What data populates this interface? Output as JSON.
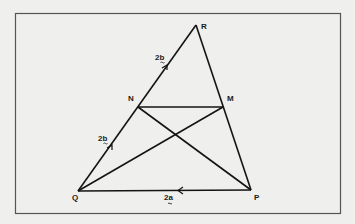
{
  "diagram": {
    "colors": {
      "background": "#efefed",
      "frame": "#555555",
      "line": "#141414"
    },
    "vertices": {
      "R": {
        "label": "R",
        "x": 196,
        "y": 25
      },
      "N": {
        "label": "N",
        "x": 138,
        "y": 107
      },
      "M": {
        "label": "M",
        "x": 223,
        "y": 107
      },
      "Q": {
        "label": "Q",
        "x": 78,
        "y": 191
      },
      "P": {
        "label": "P",
        "x": 251,
        "y": 190
      }
    },
    "segments": [
      "QR",
      "RP",
      "QP",
      "NM",
      "NP",
      "QM"
    ],
    "vector_labels": {
      "NR": {
        "text": "2b",
        "tilde": true
      },
      "QN": {
        "text": "2b",
        "tilde": true
      },
      "PQ": {
        "text": "2a",
        "tilde": true
      }
    }
  }
}
